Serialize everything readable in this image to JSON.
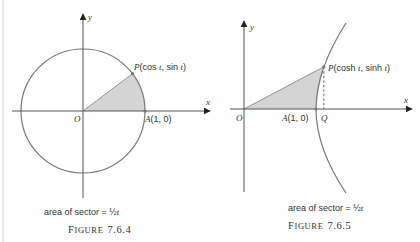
{
  "figures": [
    {
      "id": "7.6.4",
      "caption_prefix": "F",
      "caption_rest": "IGURE",
      "caption_number": "7.6.4",
      "area_text": "area of sector = ",
      "area_frac": "½",
      "area_var": "t",
      "axis_x": "x",
      "axis_y": "y",
      "origin": "O",
      "point_p": {
        "name": "P",
        "coords": "(cos t, sin t)",
        "c1": "(cos ",
        "t1": "t",
        "c2": ", sin ",
        "t2": "t",
        "c3": ")"
      },
      "point_a": {
        "name": "A",
        "coords": "(1, 0)"
      },
      "curve": "unit circle x² + y² = 1",
      "shaded_region": "circular sector OAP"
    },
    {
      "id": "7.6.5",
      "caption_prefix": "F",
      "caption_rest": "IGURE",
      "caption_number": "7.6.5",
      "area_text": "area of sector = ",
      "area_frac": "½",
      "area_var": "t",
      "axis_x": "x",
      "axis_y": "y",
      "origin": "O",
      "point_p": {
        "name": "P",
        "coords": "(cosh t, sinh t)",
        "c1": "(cosh ",
        "t1": "t",
        "c2": ", sinh ",
        "t2": "t",
        "c3": ")"
      },
      "point_a": {
        "name": "A",
        "coords": "(1, 0)"
      },
      "point_q": {
        "name": "Q"
      },
      "curve": "unit hyperbola x² − y² = 1",
      "shaded_region": "hyperbolic sector OAP"
    }
  ],
  "colors": {
    "line": "#707070",
    "axis": "#555555",
    "shade": "#d4d4d4",
    "text": "#333333"
  }
}
